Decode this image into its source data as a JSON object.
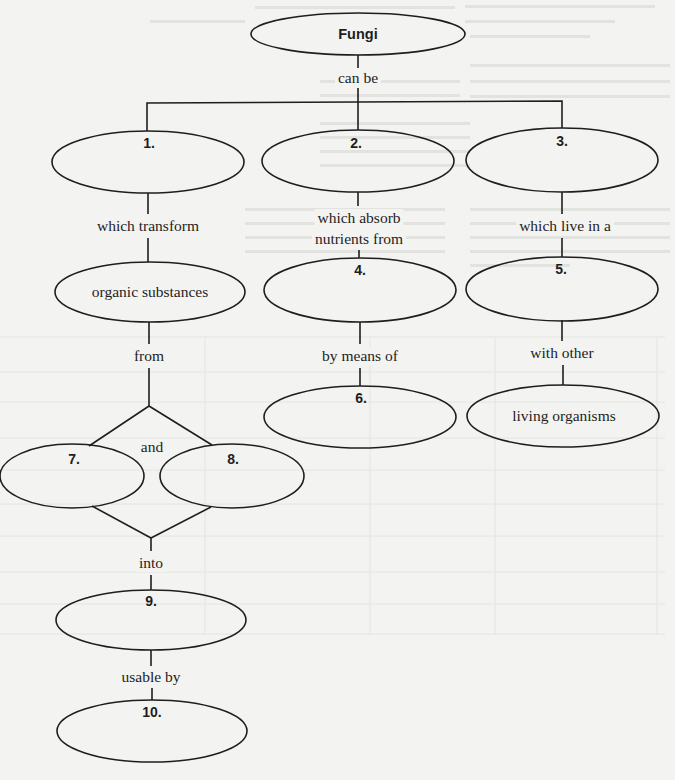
{
  "diagram": {
    "type": "concept-map",
    "root": {
      "id": "fungi",
      "label": "Fungi"
    },
    "nodes": {
      "fungi": {
        "label": "Fungi",
        "blank": false
      },
      "n1": {
        "label": "1.",
        "blank": true
      },
      "n2": {
        "label": "2.",
        "blank": true
      },
      "n3": {
        "label": "3.",
        "blank": true
      },
      "organic": {
        "label": "organic substances",
        "blank": false
      },
      "n4": {
        "label": "4.",
        "blank": true
      },
      "n5": {
        "label": "5.",
        "blank": true
      },
      "n6": {
        "label": "6.",
        "blank": true
      },
      "living": {
        "label": "living organisms",
        "blank": false
      },
      "n7": {
        "label": "7.",
        "blank": true
      },
      "n8": {
        "label": "8.",
        "blank": true
      },
      "n9": {
        "label": "9.",
        "blank": true
      },
      "n10": {
        "label": "10.",
        "blank": true
      }
    },
    "links": {
      "can_be": "can be",
      "which_transform": "which transform",
      "which_absorb_1": "which absorb",
      "which_absorb_2": "nutrients from",
      "which_live": "which live in a",
      "from": "from",
      "by_means_of": "by means of",
      "with_other": "with other",
      "and": "and",
      "into": "into",
      "usable_by": "usable by"
    },
    "edges": [
      {
        "from": "fungi",
        "to": "n1",
        "label": "can be"
      },
      {
        "from": "fungi",
        "to": "n2",
        "label": "can be"
      },
      {
        "from": "fungi",
        "to": "n3",
        "label": "can be"
      },
      {
        "from": "n1",
        "to": "organic",
        "label": "which transform"
      },
      {
        "from": "n2",
        "to": "n4",
        "label": "which absorb nutrients from"
      },
      {
        "from": "n3",
        "to": "n5",
        "label": "which live in a"
      },
      {
        "from": "organic",
        "to": "n7",
        "label": "from"
      },
      {
        "from": "organic",
        "to": "n8",
        "label": "from"
      },
      {
        "from": "n4",
        "to": "n6",
        "label": "by means of"
      },
      {
        "from": "n5",
        "to": "living",
        "label": "with other"
      },
      {
        "from": "n7",
        "to": "n9",
        "label": "into"
      },
      {
        "from": "n8",
        "to": "n9",
        "label": "into"
      },
      {
        "from": "n9",
        "to": "n10",
        "label": "usable by"
      }
    ]
  }
}
